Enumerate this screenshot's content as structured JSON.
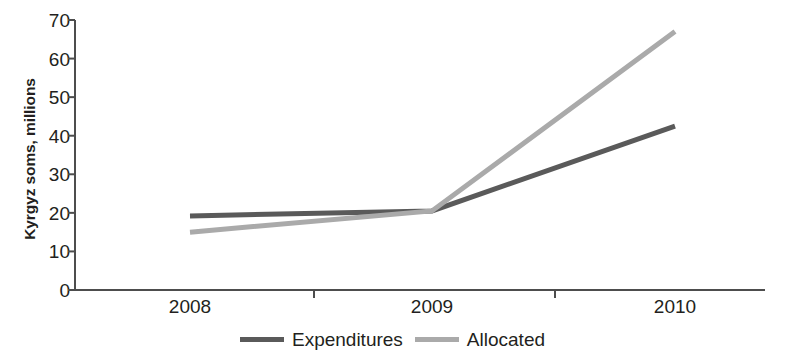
{
  "chart_data": {
    "type": "line",
    "title": "",
    "xlabel": "",
    "ylabel": "Kyrgyz soms, millions",
    "categories": [
      "2008",
      "2009",
      "2010"
    ],
    "ylim": [
      0,
      70
    ],
    "yticks": [
      0,
      10,
      20,
      30,
      40,
      50,
      60,
      70
    ],
    "ytick_labels": [
      "0",
      "10",
      "20",
      "30",
      "40",
      "50",
      "60",
      "70"
    ],
    "grid": false,
    "legend_position": "bottom-center",
    "series": [
      {
        "name": "Expenditures",
        "color": "#5a5a5a",
        "values": [
          19.2,
          20.5,
          42.5
        ]
      },
      {
        "name": "Allocated",
        "color": "#aaaaaa",
        "values": [
          15.0,
          20.5,
          67.0
        ]
      }
    ]
  },
  "axis": {
    "y_title": "Kyrgyz soms, millions",
    "axis_color": "#4d4d4d"
  },
  "legend": {
    "items": [
      {
        "label": "Expenditures",
        "color": "#5a5a5a"
      },
      {
        "label": "Allocated",
        "color": "#aaaaaa"
      }
    ]
  }
}
